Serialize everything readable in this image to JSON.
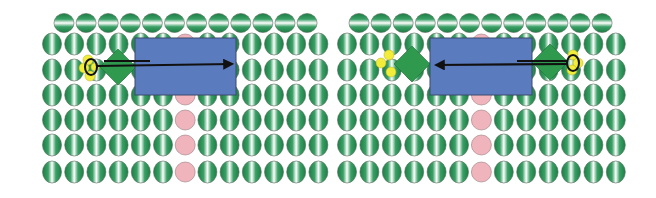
{
  "figure": {
    "width": 656,
    "height": 198,
    "colors": {
      "background": "#ffffff",
      "lipid_dark": "#1f8a4c",
      "lipid_light": "#ffffff",
      "lipid_outline": "#5a6b5e",
      "pore_pink": "#f0b4bc",
      "pore_outline": "#9a7a7e",
      "protein_blue": "#5b7bbf",
      "protein_outline": "#3a4a6a",
      "diamond_green": "#2f9a4e",
      "ligand_yellow": "#f2ec3a",
      "arrow_black": "#111111"
    },
    "panels": [
      {
        "id": "left",
        "top_row": {
          "count": 12,
          "x0": 64,
          "dx": 22.1,
          "y": 23,
          "rx": 10,
          "ry": 9.5
        },
        "grid": {
          "cols": 13,
          "x0": 52,
          "dx": 22.2,
          "rows_y": [
            44,
            70,
            95,
            120,
            145,
            172
          ],
          "rx": 9.5,
          "ry": 11
        },
        "pink_col": 6,
        "protein_rect": {
          "x": 135,
          "y": 38,
          "w": 101,
          "h": 57
        },
        "diamonds": [
          {
            "cx": 118,
            "cy": 67,
            "r": 18
          }
        ],
        "yellow_dots": [
          {
            "cx": 88,
            "cy": 60,
            "r": 5
          },
          {
            "cx": 84,
            "cy": 68,
            "r": 5
          },
          {
            "cx": 90,
            "cy": 76,
            "r": 5
          },
          {
            "cx": 95,
            "cy": 67,
            "r": 4
          }
        ],
        "ring": {
          "cx": 91,
          "cy": 67,
          "rx": 6,
          "ry": 8
        },
        "arrow": {
          "x1": 96,
          "y1": 66,
          "x2": 232,
          "y2": 64,
          "direction": "right"
        },
        "bar": {
          "x1": 104,
          "y1": 61,
          "x2": 150,
          "y2": 61
        }
      },
      {
        "id": "right",
        "top_row": {
          "count": 12,
          "x0": 359,
          "dx": 22.1,
          "y": 23,
          "rx": 10,
          "ry": 9.5
        },
        "grid": {
          "cols": 13,
          "x0": 347,
          "dx": 22.4,
          "rows_y": [
            44,
            70,
            95,
            120,
            145,
            172
          ],
          "rx": 9.5,
          "ry": 11
        },
        "pink_col": 6,
        "protein_rect": {
          "x": 430,
          "y": 38,
          "w": 102,
          "h": 57
        },
        "diamonds": [
          {
            "cx": 412,
            "cy": 64,
            "r": 18
          },
          {
            "cx": 550,
            "cy": 62,
            "r": 18
          }
        ],
        "yellow_dots": [
          {
            "cx": 389,
            "cy": 55,
            "r": 5
          },
          {
            "cx": 381,
            "cy": 63,
            "r": 5
          },
          {
            "cx": 391,
            "cy": 72,
            "r": 5
          },
          {
            "cx": 573,
            "cy": 55,
            "r": 5
          },
          {
            "cx": 578,
            "cy": 63,
            "r": 5
          },
          {
            "cx": 572,
            "cy": 70,
            "r": 5
          }
        ],
        "ring": {
          "cx": 573,
          "cy": 63,
          "rx": 6,
          "ry": 8
        },
        "arrow": {
          "x1": 568,
          "y1": 64,
          "x2": 436,
          "y2": 65,
          "direction": "left"
        },
        "bar": {
          "x1": 517,
          "y1": 61,
          "x2": 568,
          "y2": 61
        }
      }
    ]
  }
}
